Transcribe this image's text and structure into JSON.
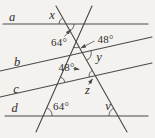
{
  "colors": {
    "background": "#f3f2ef",
    "line": "#4a4947",
    "text": "#2e2d2b"
  },
  "lines": {
    "a": "a",
    "b": "b",
    "c": "c",
    "d": "d"
  },
  "angles": {
    "x": "x",
    "top_64": "64°",
    "top_48": "48°",
    "y": "y",
    "mid_48": "48°",
    "z": "z",
    "bottom_64": "64°",
    "v": "v"
  }
}
